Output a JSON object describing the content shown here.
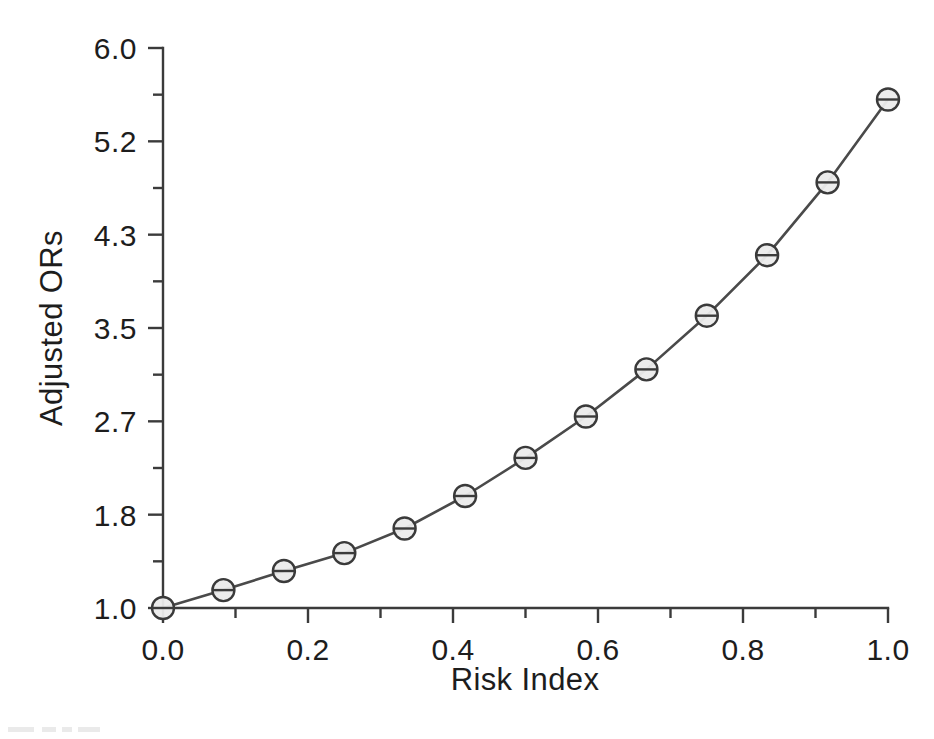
{
  "figure": {
    "background_color": "#ffffff",
    "ink_color": "#3b3b3b",
    "marker_fill_color": "#ebebeb"
  },
  "chart_data": {
    "type": "line",
    "title": "",
    "subtitle": "",
    "xlabel": "Risk Index",
    "ylabel": "Adjusted ORs",
    "xlim": [
      0.0,
      1.0
    ],
    "ylim": [
      1.0,
      6.0
    ],
    "grid": false,
    "legend": null,
    "legend_position": "none",
    "marker": "circle-with-horizontal-bar",
    "x_tick_labels": [
      "0.0",
      "0.2",
      "0.4",
      "0.6",
      "0.8",
      "1.0"
    ],
    "x_tick_values": [
      0.0,
      0.2,
      0.4,
      0.6,
      0.8,
      1.0
    ],
    "x_minor_tick_values": [
      0.1,
      0.3,
      0.5,
      0.7,
      0.9
    ],
    "y_tick_labels": [
      "1.0",
      "1.8",
      "2.7",
      "3.5",
      "4.3",
      "5.2",
      "6.0"
    ],
    "y_tick_values": [
      1.0,
      1.8333,
      2.6667,
      3.5,
      4.3333,
      5.1667,
      6.0
    ],
    "y_minor_tick_values": [
      1.4167,
      2.25,
      3.0833,
      3.9167,
      4.75,
      5.5833
    ],
    "x": [
      0.0,
      0.0833,
      0.1667,
      0.25,
      0.3333,
      0.4167,
      0.5,
      0.5833,
      0.6667,
      0.75,
      0.8333,
      0.9167,
      1.0
    ],
    "values": [
      1.0,
      1.16,
      1.33,
      1.49,
      1.71,
      2.0,
      2.34,
      2.71,
      3.13,
      3.61,
      4.15,
      4.8,
      5.54
    ],
    "series": [
      {
        "name": "Adjusted ORs",
        "values": [
          1.0,
          1.16,
          1.33,
          1.49,
          1.71,
          2.0,
          2.34,
          2.71,
          3.13,
          3.61,
          4.15,
          4.8,
          5.54
        ]
      }
    ],
    "annotations": []
  },
  "axes": {
    "x_title": "Risk Index",
    "y_title": "Adjusted ORs"
  }
}
